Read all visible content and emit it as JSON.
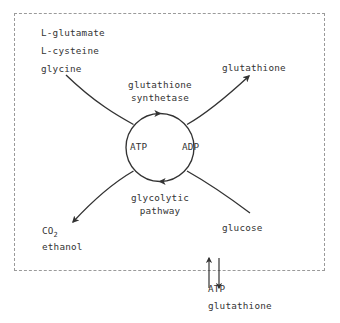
{
  "diagram": {
    "boundary": {
      "name": "cell-membrane",
      "style": "dashed"
    },
    "colors": {
      "stroke": "#333333",
      "text": "#333333",
      "boundary": "#9a9a9a",
      "background": "#ffffff"
    },
    "substrates": {
      "line1": "L-glutamate",
      "line2": "L-cysteine",
      "line3": "glycine"
    },
    "product_top_right": "glutathione",
    "enzyme": {
      "line1": "glutathione",
      "line2": "synthetase"
    },
    "cofactors": {
      "left": "ATP",
      "right": "ADP"
    },
    "pathway": {
      "line1": "glycolytic",
      "line2": "pathway"
    },
    "products_bottom_left": {
      "co2_base": "CO",
      "co2_subscript": "2",
      "line2": "ethanol"
    },
    "substrate_bottom_right": "glucose",
    "transport": {
      "label1": "ATP",
      "label2": "glutathione",
      "arrow_up_direction": "up",
      "arrow_down_direction": "down"
    }
  }
}
